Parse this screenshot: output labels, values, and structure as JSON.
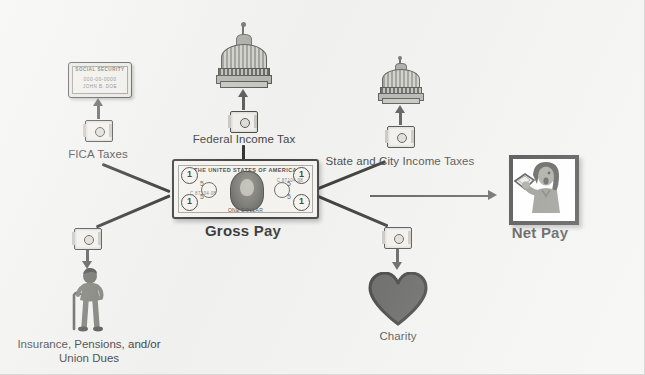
{
  "diagram": {
    "background_color": "#f0f0ef",
    "line_color": "#101010",
    "arrow_color": "#3d3d3d"
  },
  "center": {
    "label": "Gross Pay",
    "icon": "dollar-bill-icon",
    "bill_top_text": "THE UNITED STATES OF AMERICA",
    "bill_bottom_text": "ONE DOLLAR",
    "bill_corner_value": "1",
    "bill_small_value": "5",
    "bill_serial_left": "C 87104 08",
    "bill_serial_right": "C 87104 08"
  },
  "result": {
    "label": "Net Pay",
    "icon": "person-holding-money-icon"
  },
  "deductions": [
    {
      "id": "fica",
      "label": "FICA Taxes",
      "icon": "social-security-card-icon",
      "card_title": "SOCIAL SECURITY",
      "card_number": "000-00-0000",
      "card_name": "JOHN B. DOE"
    },
    {
      "id": "federal",
      "label": "Federal Income Tax",
      "icon": "capitol-dome-icon"
    },
    {
      "id": "state-city",
      "label": "State and City Income Taxes",
      "icon": "capitol-dome-icon"
    },
    {
      "id": "insurance",
      "label": "Insurance, Pensions, and/or Union Dues",
      "icon": "person-with-cane-icon"
    },
    {
      "id": "charity",
      "label": "Charity",
      "icon": "heart-icon"
    }
  ]
}
